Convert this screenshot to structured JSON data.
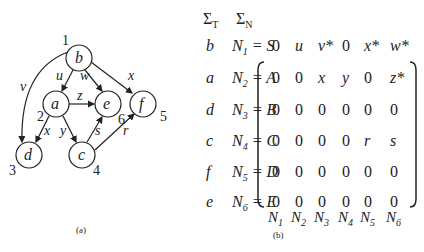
{
  "graph": {
    "nodes": [
      {
        "id": "b",
        "label": "b",
        "num": "1",
        "x": 79,
        "y": 58
      },
      {
        "id": "a",
        "label": "a",
        "num": "2",
        "x": 56,
        "y": 104
      },
      {
        "id": "d",
        "label": "d",
        "num": "3",
        "x": 29,
        "y": 155
      },
      {
        "id": "c",
        "label": "c",
        "num": "4",
        "x": 82,
        "y": 155
      },
      {
        "id": "f",
        "label": "f",
        "num": "5",
        "x": 143,
        "y": 104
      },
      {
        "id": "e",
        "label": "e",
        "num": "6",
        "x": 108,
        "y": 104
      }
    ],
    "edges": [
      {
        "from": "b",
        "to": "a",
        "label": "u"
      },
      {
        "from": "b",
        "to": "e",
        "label": "w"
      },
      {
        "from": "b",
        "to": "f",
        "label": "x"
      },
      {
        "from": "b",
        "to": "d",
        "label": "v"
      },
      {
        "from": "a",
        "to": "e",
        "label": "z"
      },
      {
        "from": "a",
        "to": "d",
        "label": "x"
      },
      {
        "from": "a",
        "to": "c",
        "label": "y"
      },
      {
        "from": "c",
        "to": "e",
        "label": "s"
      },
      {
        "from": "c",
        "to": "f",
        "label": "r"
      }
    ],
    "caption": "(a)"
  },
  "table": {
    "header_t": "Σ",
    "header_t_sub": "T",
    "header_n": "Σ",
    "header_n_sub": "N",
    "rows": [
      {
        "t": "b",
        "n": "N",
        "sub": "1",
        "eq": "= S"
      },
      {
        "t": "a",
        "n": "N",
        "sub": "2",
        "eq": "= A"
      },
      {
        "t": "d",
        "n": "N",
        "sub": "3",
        "eq": "= B"
      },
      {
        "t": "c",
        "n": "N",
        "sub": "4",
        "eq": "= C"
      },
      {
        "t": "f",
        "n": "N",
        "sub": "5",
        "eq": "= D"
      },
      {
        "t": "e",
        "n": "N",
        "sub": "6",
        "eq": "= E"
      }
    ],
    "matrix": [
      [
        "0",
        "u",
        "v*",
        "0",
        "x*",
        "w*"
      ],
      [
        "0",
        "0",
        "x",
        "y",
        "0",
        "z*"
      ],
      [
        "0",
        "0",
        "0",
        "0",
        "0",
        "0"
      ],
      [
        "0",
        "0",
        "0",
        "0",
        "r",
        "s"
      ],
      [
        "0",
        "0",
        "0",
        "0",
        "0",
        "0"
      ],
      [
        "0",
        "0",
        "0",
        "0",
        "0",
        "0"
      ]
    ],
    "col_labels": [
      "1",
      "2",
      "3",
      "4",
      "5",
      "6"
    ],
    "caption": "(b)"
  }
}
